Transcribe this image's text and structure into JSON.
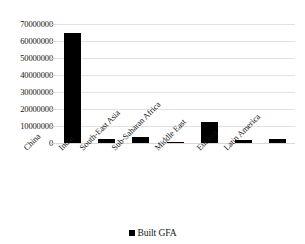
{
  "chart_data": {
    "type": "bar",
    "title": "",
    "subtitle": "",
    "xlabel": "",
    "ylabel": "",
    "categories": [
      "China",
      "India",
      "South-East Asia",
      "Sub-Saharan Africa",
      "Middle East",
      "Eurasia",
      "Latin America"
    ],
    "series": [
      {
        "name": "Built GFA",
        "color": "#000000",
        "values": [
          64500000,
          2500000,
          3800000,
          800000,
          12500000,
          2000000,
          2500000
        ]
      }
    ],
    "values": [
      64500000,
      2500000,
      3800000,
      800000,
      12500000,
      2000000,
      2500000
    ],
    "ylim": [
      0,
      70000000
    ],
    "ytick_values": [
      0,
      10000000,
      20000000,
      30000000,
      40000000,
      50000000,
      60000000,
      70000000
    ],
    "ytick_labels": [
      "0",
      "10000000",
      "20000000",
      "30000000",
      "40000000",
      "50000000",
      "60000000",
      "70000000"
    ],
    "grid": true,
    "grid_color": "#e2e2e2",
    "legend": {
      "position": "bottom",
      "entries": [
        {
          "label": "Built GFA",
          "color": "#000000",
          "marker": "square"
        }
      ]
    },
    "axis_label_rotation": -45,
    "background": "#ffffff"
  }
}
